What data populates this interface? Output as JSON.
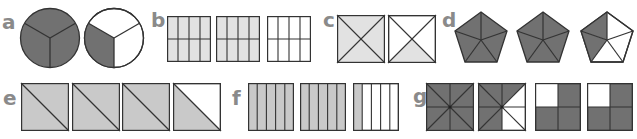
{
  "colors": {
    "dark": "#717171",
    "light_bc": "#e2e2e2",
    "light_ef": "#c9c9c9",
    "stroke": "#333333",
    "label": "#8a8a8a",
    "white": "#ffffff"
  },
  "groups": [
    {
      "label": "a",
      "shape": "circle thirds",
      "items": [
        {
          "shaded": 3,
          "parts": 3
        },
        {
          "shaded": 1,
          "parts": 3
        }
      ]
    },
    {
      "label": "b",
      "shape": "rectangle eighths",
      "items": [
        {
          "shaded": 8,
          "parts": 8
        },
        {
          "shaded": 8,
          "parts": 8
        },
        {
          "shaded": 0,
          "parts": 8
        }
      ]
    },
    {
      "label": "c",
      "shape": "square quarters (diagonals)",
      "items": [
        {
          "shaded": 4,
          "parts": 4
        },
        {
          "shaded": 1,
          "parts": 4
        }
      ]
    },
    {
      "label": "d",
      "shape": "pentagon fifths",
      "items": [
        {
          "shaded": 5,
          "parts": 5
        },
        {
          "shaded": 5,
          "parts": 5
        },
        {
          "shaded": 2,
          "parts": 5
        }
      ]
    },
    {
      "label": "e",
      "shape": "square halves (diagonal)",
      "items": [
        {
          "shaded": 2,
          "parts": 2
        },
        {
          "shaded": 2,
          "parts": 2
        },
        {
          "shaded": 2,
          "parts": 2
        },
        {
          "shaded": 1,
          "parts": 2
        }
      ]
    },
    {
      "label": "f",
      "shape": "rectangle fifths (vertical strips)",
      "items": [
        {
          "shaded": 5,
          "parts": 5
        },
        {
          "shaded": 5,
          "parts": 5
        },
        {
          "shaded": 1,
          "parts": 5
        }
      ]
    },
    {
      "label": "g",
      "shape": "square eighths and quarters",
      "items": [
        {
          "shaded": 8,
          "parts": 8
        },
        {
          "shaded": 5,
          "parts": 8
        },
        {
          "shaded": 3,
          "parts": 4
        },
        {
          "shaded": 3,
          "parts": 4
        }
      ]
    }
  ]
}
